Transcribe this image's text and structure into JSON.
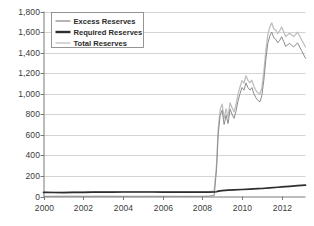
{
  "chart_data": {
    "type": "line",
    "title": "",
    "subtitle": "",
    "xlabel": "",
    "ylabel": "",
    "units": "Billions of dollars",
    "xlim": [
      2000,
      2013.2
    ],
    "ylim": [
      0,
      1800
    ],
    "grid": true,
    "legend_position": "top-left",
    "y_ticks": [
      0,
      200,
      400,
      600,
      800,
      1000,
      1200,
      1400,
      1600,
      1800
    ],
    "y_tick_labels": [
      "0",
      "200",
      "400",
      "600",
      "800",
      "1,000",
      "1,200",
      "1,400",
      "1,600",
      "1,800"
    ],
    "x_ticks": [
      2000,
      2002,
      2004,
      2006,
      2008,
      2010,
      2012
    ],
    "x_tick_labels": [
      "2000",
      "2002",
      "2004",
      "2006",
      "2008",
      "2010",
      "2012"
    ],
    "colors": {
      "excess": "#8d8d8d",
      "required": "#2e2e2e",
      "total": "#bfbfbf",
      "grid": "#c9c9c9",
      "axis": "#7a7a7a",
      "text": "#3a3a3a"
    },
    "series": [
      {
        "name": "Excess Reserves",
        "color": "#8d8d8d",
        "width": 1.0,
        "x": [
          2000.0,
          2000.5,
          2001.0,
          2001.5,
          2002.0,
          2002.5,
          2003.0,
          2003.5,
          2004.0,
          2004.5,
          2005.0,
          2005.5,
          2006.0,
          2006.5,
          2007.0,
          2007.5,
          2008.0,
          2008.3,
          2008.6,
          2008.72,
          2008.8,
          2008.9,
          2009.0,
          2009.1,
          2009.2,
          2009.3,
          2009.4,
          2009.5,
          2009.6,
          2009.7,
          2009.8,
          2009.9,
          2010.0,
          2010.1,
          2010.2,
          2010.3,
          2010.4,
          2010.5,
          2010.6,
          2010.7,
          2010.8,
          2010.9,
          2011.0,
          2011.1,
          2011.2,
          2011.3,
          2011.4,
          2011.5,
          2011.6,
          2011.7,
          2011.8,
          2011.9,
          2012.0,
          2012.1,
          2012.2,
          2012.4,
          2012.6,
          2012.8,
          2013.0,
          2013.2
        ],
        "values": [
          2,
          2,
          3,
          3,
          2,
          2,
          3,
          2,
          2,
          2,
          2,
          2,
          2,
          2,
          2,
          2,
          2,
          3,
          10,
          270,
          600,
          790,
          840,
          700,
          790,
          710,
          850,
          800,
          760,
          830,
          930,
          1000,
          1060,
          1035,
          1105,
          1060,
          1035,
          1060,
          1000,
          960,
          935,
          920,
          980,
          1130,
          1330,
          1490,
          1560,
          1600,
          1545,
          1530,
          1495,
          1520,
          1555,
          1510,
          1460,
          1490,
          1455,
          1495,
          1420,
          1345
        ]
      },
      {
        "name": "Required Reserves",
        "color": "#2e2e2e",
        "width": 1.7,
        "x": [
          2000.0,
          2000.5,
          2001.0,
          2001.5,
          2002.0,
          2002.5,
          2003.0,
          2003.5,
          2004.0,
          2004.5,
          2005.0,
          2005.5,
          2006.0,
          2006.5,
          2007.0,
          2007.5,
          2008.0,
          2008.3,
          2008.6,
          2008.72,
          2008.8,
          2009.0,
          2009.3,
          2009.6,
          2010.0,
          2010.4,
          2010.8,
          2011.0,
          2011.4,
          2011.8,
          2012.0,
          2012.4,
          2012.8,
          2013.0,
          2013.2
        ],
        "values": [
          41,
          39,
          38,
          40,
          40,
          42,
          42,
          43,
          44,
          44,
          44,
          44,
          43,
          43,
          42,
          42,
          42,
          43,
          44,
          46,
          52,
          58,
          62,
          64,
          68,
          72,
          76,
          78,
          84,
          90,
          93,
          99,
          105,
          108,
          110
        ]
      },
      {
        "name": "Total Reserves",
        "color": "#bfbfbf",
        "width": 1.3,
        "x": [
          2000.0,
          2000.5,
          2001.0,
          2001.5,
          2002.0,
          2002.5,
          2003.0,
          2003.5,
          2004.0,
          2004.5,
          2005.0,
          2005.5,
          2006.0,
          2006.5,
          2007.0,
          2007.5,
          2008.0,
          2008.3,
          2008.6,
          2008.72,
          2008.8,
          2008.9,
          2009.0,
          2009.1,
          2009.2,
          2009.3,
          2009.4,
          2009.5,
          2009.6,
          2009.7,
          2009.8,
          2009.9,
          2010.0,
          2010.1,
          2010.2,
          2010.3,
          2010.4,
          2010.5,
          2010.6,
          2010.7,
          2010.8,
          2010.9,
          2011.0,
          2011.1,
          2011.2,
          2011.3,
          2011.4,
          2011.5,
          2011.6,
          2011.7,
          2011.8,
          2011.9,
          2012.0,
          2012.1,
          2012.2,
          2012.4,
          2012.6,
          2012.8,
          2013.0,
          2013.2
        ],
        "values": [
          43,
          41,
          41,
          43,
          42,
          44,
          45,
          45,
          46,
          46,
          46,
          46,
          45,
          45,
          44,
          44,
          44,
          46,
          54,
          316,
          652,
          845,
          898,
          760,
          852,
          772,
          912,
          862,
          824,
          895,
          996,
          1066,
          1128,
          1103,
          1175,
          1130,
          1107,
          1132,
          1072,
          1032,
          1009,
          996,
          1058,
          1210,
          1412,
          1575,
          1648,
          1690,
          1632,
          1618,
          1585,
          1612,
          1650,
          1604,
          1556,
          1588,
          1556,
          1598,
          1525,
          1455
        ]
      }
    ],
    "legend": [
      {
        "label": "Excess Reserves",
        "color": "#8d8d8d",
        "width": 1.3
      },
      {
        "label": "Required Reserves",
        "color": "#2e2e2e",
        "width": 2.4
      },
      {
        "label": "Total Reserves",
        "color": "#cccccc",
        "width": 1.6
      }
    ]
  }
}
